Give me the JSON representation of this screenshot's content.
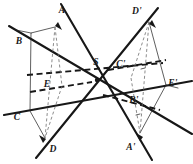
{
  "figure": {
    "center_label": "S",
    "background_color": "#ffffff",
    "ink_color": "#171717",
    "thin_color": "#2a2a2a",
    "dashed_light_color": "#6e6e6e",
    "labels": {
      "A": "A",
      "B": "B",
      "C": "C",
      "D": "D",
      "E": "E",
      "S": "S",
      "A_prime": "A'",
      "B_prime": "B'",
      "C_prime": "C'",
      "D_prime": "D'",
      "E_prime": "E'"
    },
    "label_positions": {
      "A": {
        "x": 62,
        "y": 11
      },
      "B": {
        "x": 19,
        "y": 42
      },
      "C": {
        "x": 17,
        "y": 118
      },
      "D": {
        "x": 53,
        "y": 150
      },
      "E": {
        "x": 47,
        "y": 85
      },
      "S": {
        "x": 96,
        "y": 63
      },
      "A_prime": {
        "x": 131,
        "y": 148
      },
      "B_prime": {
        "x": 134,
        "y": 101
      },
      "C_prime": {
        "x": 121,
        "y": 65
      },
      "D_prime": {
        "x": 137,
        "y": 12
      },
      "E_prime": {
        "x": 173,
        "y": 84
      }
    },
    "center_point": {
      "x": 97,
      "y": 80
    },
    "vertices": {
      "A": {
        "x": 55,
        "y": 27
      },
      "B": {
        "x": 16,
        "y": 30
      },
      "C": {
        "x": 15,
        "y": 109
      },
      "D": {
        "x": 45,
        "y": 138
      },
      "E": {
        "x": 55,
        "y": 82
      },
      "A_prime": {
        "x": 140,
        "y": 133
      },
      "B_prime": {
        "x": 178,
        "y": 130
      },
      "C_prime": {
        "x": 179,
        "y": 51
      },
      "D_prime": {
        "x": 149,
        "y": 22
      },
      "E_prime": {
        "x": 139,
        "y": 78
      }
    },
    "ray_pairs": [
      {
        "name": "ray-A-Aprime",
        "from": "A",
        "to": "A_prime"
      },
      {
        "name": "ray-B-Bprime",
        "from": "B",
        "to": "B_prime"
      },
      {
        "name": "ray-C-Cprime",
        "from": "C",
        "to": "C_prime"
      },
      {
        "name": "ray-D-Dprime",
        "from": "D",
        "to": "D_prime"
      },
      {
        "name": "ray-E-Eprime",
        "from": "E",
        "to": "E_prime"
      }
    ]
  }
}
